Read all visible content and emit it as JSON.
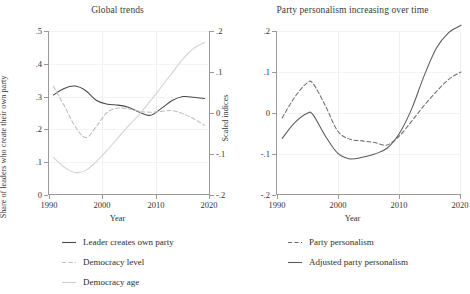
{
  "figure": {
    "xlabel": "Year"
  },
  "panels": [
    {
      "id": "left",
      "title": "Global trends",
      "ylabel_left": "Share of leaders who create their own party",
      "ylabel_right": "Scaled indices",
      "xlabel": "Year",
      "xticks": [
        "1990",
        "2000",
        "2010",
        "2020"
      ],
      "yticks_left": [
        "0",
        ".1",
        ".2",
        ".3",
        ".4",
        ".5"
      ],
      "yticks_right": [
        "-.2",
        "-.1",
        "0",
        ".1",
        ".2"
      ],
      "legend": [
        {
          "label": "Leader creates own party",
          "style": "solid",
          "color": "#4a4a4a"
        },
        {
          "label": "Democracy level",
          "style": "dashed",
          "color": "#b9b9b9"
        },
        {
          "label": "Democracy age",
          "style": "solid",
          "color": "#cfcfcf"
        }
      ]
    },
    {
      "id": "right",
      "title": "Party personalism increasing over time",
      "ylabel_left": "",
      "xlabel": "Year",
      "xticks": [
        "1990",
        "2000",
        "2010",
        "2020"
      ],
      "yticks_left": [
        "-.2",
        "-.1",
        "0",
        ".1",
        ".2"
      ],
      "legend": [
        {
          "label": "Party personalism",
          "style": "dashed",
          "color": "#6a6a6a"
        },
        {
          "label": "Adjusted party personalism",
          "style": "solid",
          "color": "#5a5a5a"
        }
      ]
    }
  ],
  "chart_data": [
    {
      "type": "line",
      "title": "Global trends",
      "xlabel": "Year",
      "ylabel": "Share of leaders who create their own party",
      "ylabel_secondary": "Scaled indices",
      "xlim": [
        1990,
        2020
      ],
      "ylim": [
        0,
        0.5
      ],
      "ylim_secondary": [
        -0.2,
        0.2
      ],
      "xticks": [
        1990,
        2000,
        2010,
        2020
      ],
      "yticks": [
        0,
        0.1,
        0.2,
        0.3,
        0.4,
        0.5
      ],
      "yticks_secondary": [
        -0.2,
        -0.1,
        0,
        0.1,
        0.2
      ],
      "grid": true,
      "legend_position": "below",
      "x": [
        1991,
        1993,
        1995,
        1997,
        1999,
        2001,
        2003,
        2005,
        2007,
        2009,
        2011,
        2013,
        2015,
        2017,
        2019
      ],
      "series": [
        {
          "name": "Leader creates own party",
          "axis": "left",
          "style": "solid",
          "values": [
            0.305,
            0.325,
            0.332,
            0.318,
            0.288,
            0.277,
            0.274,
            0.267,
            0.252,
            0.243,
            0.264,
            0.288,
            0.3,
            0.298,
            0.294
          ]
        },
        {
          "name": "Democracy level",
          "axis": "right",
          "style": "dashed",
          "values": [
            0.065,
            0.018,
            -0.032,
            -0.06,
            -0.032,
            0.002,
            0.012,
            0.01,
            0.004,
            0.002,
            0.004,
            0.006,
            -0.002,
            -0.014,
            -0.03
          ]
        },
        {
          "name": "Democracy age",
          "axis": "right",
          "style": "solid",
          "values": [
            -0.108,
            -0.132,
            -0.145,
            -0.14,
            -0.118,
            -0.09,
            -0.06,
            -0.03,
            -0.002,
            0.03,
            0.064,
            0.098,
            0.132,
            0.158,
            0.172
          ]
        }
      ]
    },
    {
      "type": "line",
      "title": "Party personalism increasing over time",
      "xlabel": "Year",
      "ylabel": "",
      "xlim": [
        1990,
        2020
      ],
      "ylim": [
        -0.2,
        0.2
      ],
      "xticks": [
        1990,
        2000,
        2010,
        2020
      ],
      "yticks": [
        -0.2,
        -0.1,
        0,
        0.1,
        0.2
      ],
      "grid": true,
      "legend_position": "below",
      "x": [
        1991,
        1993,
        1995,
        1996,
        1998,
        2000,
        2002,
        2004,
        2006,
        2008,
        2010,
        2012,
        2014,
        2016,
        2018,
        2020
      ],
      "series": [
        {
          "name": "Party personalism",
          "style": "dashed",
          "values": [
            -0.012,
            0.038,
            0.073,
            0.072,
            0.018,
            -0.044,
            -0.064,
            -0.068,
            -0.072,
            -0.078,
            -0.056,
            -0.02,
            0.018,
            0.052,
            0.082,
            0.1
          ]
        },
        {
          "name": "Adjusted party personalism",
          "style": "solid",
          "values": [
            -0.062,
            -0.024,
            -0.001,
            -0.004,
            -0.056,
            -0.098,
            -0.112,
            -0.108,
            -0.1,
            -0.086,
            -0.05,
            0.01,
            0.09,
            0.158,
            0.196,
            0.214
          ]
        }
      ]
    }
  ]
}
